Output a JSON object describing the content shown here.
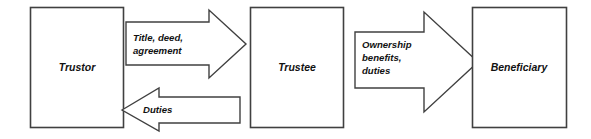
{
  "diagram": {
    "stroke_color": "#404040",
    "fill_color": "#ffffff",
    "text_color": "#111111",
    "nodes": [
      {
        "id": "trustor",
        "label": "Trustor"
      },
      {
        "id": "trustee",
        "label": "Trustee"
      },
      {
        "id": "beneficiary",
        "label": "Beneficiary"
      }
    ],
    "arrows": [
      {
        "id": "trustor-to-trustee",
        "direction": "right",
        "from": "trustor",
        "to": "trustee",
        "label_lines": [
          "Title, deed,",
          "agreement"
        ]
      },
      {
        "id": "trustee-to-trustor",
        "direction": "left",
        "from": "trustee",
        "to": "trustor",
        "label_lines": [
          "Duties"
        ]
      },
      {
        "id": "trustee-to-beneficiary",
        "direction": "right",
        "from": "trustee",
        "to": "beneficiary",
        "label_lines": [
          "Ownership",
          "benefits,",
          "duties"
        ]
      }
    ]
  }
}
